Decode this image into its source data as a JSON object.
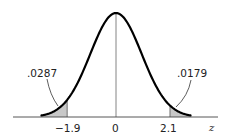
{
  "chart_data": {
    "type": "area",
    "title": "",
    "xlabel": "z",
    "ylabel": "",
    "xlim": [
      -3.5,
      3.5
    ],
    "x_ticks": [
      "-1.9",
      "0",
      "2.1"
    ],
    "tick_values": [
      -1.9,
      0,
      2.1
    ],
    "grid": false,
    "legend": null,
    "shaded_regions": [
      {
        "from": "-inf",
        "to": -1.9,
        "area": 0.0287,
        "label": ".0287"
      },
      {
        "from": 2.1,
        "to": "inf",
        "area": 0.0179,
        "label": ".0179"
      }
    ],
    "annotations": [
      {
        "text": ".0287",
        "points_to": "left tail area"
      },
      {
        "text": ".0179",
        "points_to": "right tail area"
      }
    ],
    "colors": {
      "curve": "#000000",
      "shade": "#c8c8c8",
      "axis": "#444444"
    }
  },
  "labels": {
    "left_area": ".0287",
    "right_area": ".0179",
    "tick_left": "−1.9",
    "tick_center": "0",
    "tick_right": "2.1",
    "axis_var": "z"
  }
}
